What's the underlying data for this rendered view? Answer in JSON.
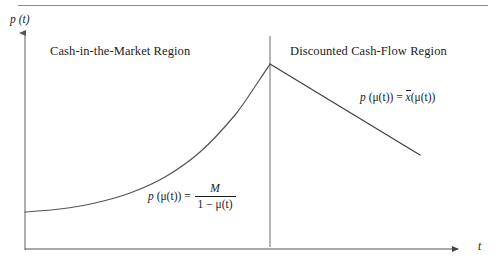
{
  "figure": {
    "background_color": "#ffffff",
    "ink_color": "#1b1b1b",
    "rule_color": "#8d8d8d",
    "axis_label_y": "p (t)",
    "axis_label_x": "t"
  },
  "regions": {
    "left_label": "Cash-in-the-Market Region",
    "right_label": "Discounted Cash-Flow Region"
  },
  "formulas": {
    "left": {
      "lhs_p": "p",
      "lhs_arg": "(μ(t))",
      "equals": "=",
      "numerator": "M",
      "denominator_one": "1",
      "denominator_minus": "−",
      "denominator_mu": "μ(t)",
      "plain": "p (μ(t)) = M / (1 − μ(t))"
    },
    "right": {
      "lhs_p": "p",
      "lhs_arg": "(μ(t))",
      "equals": "=",
      "rhs_bar_var": "x",
      "rhs_arg": "(μ(t))",
      "plain": "p (μ(t)) = x̄(μ(t))"
    }
  },
  "chart_data": {
    "type": "line",
    "title": "",
    "xlabel": "t",
    "ylabel": "p (t)",
    "grid": false,
    "legend": "none",
    "axis_origin_px": {
      "x": 25,
      "y": 249
    },
    "axis_extent_px": {
      "x_end": 462,
      "y_top": 28
    },
    "annotations": [
      {
        "name": "region-divider",
        "type": "vertical-line",
        "x_px": 270,
        "y_top_px": 36,
        "y_bottom_px": 247
      },
      {
        "name": "peak-point",
        "type": "point",
        "x_px": 270,
        "y_px": 64
      }
    ],
    "series": [
      {
        "name": "Cash-in-the-Market branch",
        "shape": "convex-increasing",
        "formula": "p (μ(t)) = M / (1 − μ(t))",
        "points_px": [
          [
            25,
            212
          ],
          [
            60,
            209
          ],
          [
            95,
            203
          ],
          [
            130,
            193
          ],
          [
            165,
            177
          ],
          [
            200,
            152
          ],
          [
            235,
            115
          ],
          [
            258,
            82
          ],
          [
            270,
            64
          ]
        ]
      },
      {
        "name": "Discounted Cash-Flow branch",
        "shape": "linear-decreasing",
        "formula": "p (μ(t)) = x̄(μ(t))",
        "points_px": [
          [
            270,
            64
          ],
          [
            420,
            155
          ]
        ]
      }
    ]
  }
}
